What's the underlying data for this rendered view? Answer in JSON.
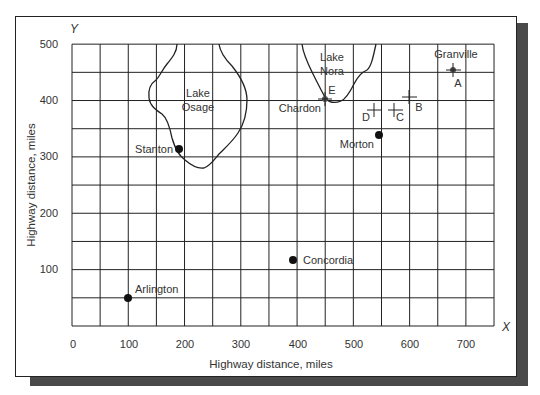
{
  "chart_data": {
    "type": "scatter",
    "title": "",
    "xlabel": "Highway distance, miles",
    "ylabel": "Highway distance, miles",
    "x_axis_letter": "X",
    "y_axis_letter": "Y",
    "xlim": [
      0,
      750
    ],
    "ylim": [
      0,
      500
    ],
    "grid": true,
    "grid_step": 50,
    "x_ticks": [
      0,
      100,
      200,
      300,
      400,
      500,
      600,
      700
    ],
    "y_ticks": [
      100,
      200,
      300,
      400,
      500
    ],
    "x_tick_labels": [
      "0",
      "100",
      "200",
      "300",
      "400",
      "500",
      "600",
      "700"
    ],
    "y_tick_labels": [
      "100",
      "200",
      "300",
      "400",
      "500"
    ],
    "cities": [
      {
        "name": "Arlington",
        "x": 100,
        "y": 50,
        "marker": "dot"
      },
      {
        "name": "Stanton",
        "x": 190,
        "y": 315,
        "marker": "dot"
      },
      {
        "name": "Concordia",
        "x": 390,
        "y": 120,
        "marker": "dot"
      },
      {
        "name": "Morton",
        "x": 545,
        "y": 340,
        "marker": "dot"
      },
      {
        "name": "Granville",
        "x": 680,
        "y": 455,
        "marker": "cross-dot",
        "point_label": "A"
      },
      {
        "name": "Chardon",
        "x": 450,
        "y": 400,
        "marker": "cross-dot",
        "point_label": "E"
      }
    ],
    "candidate_points": [
      {
        "label": "A",
        "x": 680,
        "y": 455
      },
      {
        "label": "B",
        "x": 600,
        "y": 408
      },
      {
        "label": "C",
        "x": 575,
        "y": 385
      },
      {
        "label": "D",
        "x": 540,
        "y": 385
      },
      {
        "label": "E",
        "x": 450,
        "y": 400
      }
    ],
    "regions": [
      {
        "name": "Lake Osage",
        "label_lines": [
          "Lake",
          "Osage"
        ]
      },
      {
        "name": "Lake Nora",
        "label_lines": [
          "Lake",
          "Nora"
        ]
      }
    ]
  }
}
